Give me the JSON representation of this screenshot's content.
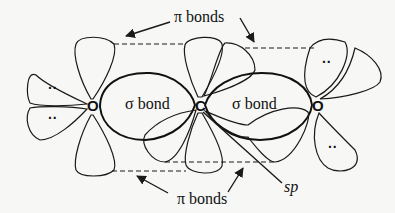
{
  "diagram": {
    "atoms": {
      "left_oxygen": "O",
      "carbon": "C",
      "right_oxygen": "O"
    },
    "labels": {
      "pi_bonds_top": "π bonds",
      "pi_bonds_bottom": "π bonds",
      "sigma_bond_left": "σ bond",
      "sigma_bond_right": "σ bond",
      "sp": "sp"
    },
    "lone_pairs": {
      "left_upper": "··",
      "left_lower": "··",
      "right_upper": "··",
      "right_lower": "··"
    },
    "colors": {
      "line": "#1a1a1a",
      "background": "#f7f7f5"
    }
  }
}
